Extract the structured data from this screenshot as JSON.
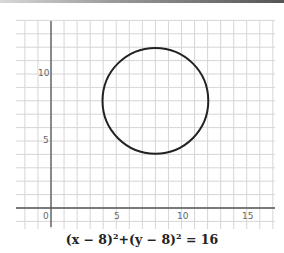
{
  "chart_data": {
    "type": "line",
    "title": "",
    "caption": "(x − 8)²+(y − 8)² = 16",
    "xlabel": "",
    "ylabel": "",
    "xlim": [
      -2.7,
      17.2
    ],
    "ylim": [
      -1.6,
      14
    ],
    "x_ticks": [
      0,
      5,
      10,
      15
    ],
    "y_ticks": [
      5,
      10
    ],
    "grid": true,
    "series": [
      {
        "name": "circle",
        "shape": "circle",
        "center": [
          8,
          8
        ],
        "radius": 4,
        "color": "#222222"
      }
    ]
  },
  "labels": {
    "x0": "0",
    "x5": "5",
    "x10": "10",
    "x15": "15",
    "y5": "5",
    "y10": "10"
  },
  "equation": {
    "left": "(x − 8)",
    "sup1": "2",
    "mid": "+(y − 8)",
    "sup2": "2",
    "right": " = 16"
  },
  "colors": {
    "grid": "#d6d6d6",
    "axis": "#555555",
    "curve": "#222222"
  }
}
